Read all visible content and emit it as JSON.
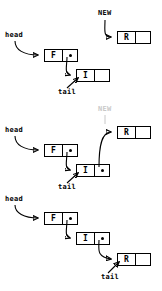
{
  "diagram": {
    "type": "linked-list-insertion",
    "labels": {
      "head": "head",
      "tail": "tail",
      "new": "NEW"
    },
    "node_values": {
      "first": "F",
      "middle": "I",
      "new": "R"
    },
    "colors": {
      "stroke": "#000000",
      "dim": "#c8c8c8",
      "background": "#ffffff"
    },
    "stages": [
      {
        "id": "stage-1",
        "caption": "",
        "nodes": [
          {
            "name": "node-f",
            "value": "F",
            "pointer": "filled"
          },
          {
            "name": "node-i",
            "value": "I",
            "pointer": "null"
          },
          {
            "name": "node-r",
            "value": "R",
            "pointer": "null"
          }
        ],
        "pointers": [
          {
            "from": "head",
            "to": "node-f"
          },
          {
            "from": "node-f",
            "to": "node-i"
          },
          {
            "from": "tail",
            "to": "node-i"
          },
          {
            "from": "NEW",
            "to": "node-r"
          }
        ]
      },
      {
        "id": "stage-2",
        "caption": "",
        "nodes": [
          {
            "name": "node-f",
            "value": "F",
            "pointer": "filled"
          },
          {
            "name": "node-i",
            "value": "I",
            "pointer": "filled"
          },
          {
            "name": "node-r",
            "value": "R",
            "pointer": "null"
          }
        ],
        "pointers": [
          {
            "from": "head",
            "to": "node-f"
          },
          {
            "from": "node-f",
            "to": "node-i"
          },
          {
            "from": "tail",
            "to": "node-i"
          },
          {
            "from": "node-i",
            "to": "node-r"
          },
          {
            "from": "NEW",
            "to": "node-r",
            "state": "dimmed"
          }
        ]
      },
      {
        "id": "stage-3",
        "caption": "",
        "nodes": [
          {
            "name": "node-f",
            "value": "F",
            "pointer": "filled"
          },
          {
            "name": "node-i",
            "value": "I",
            "pointer": "filled"
          },
          {
            "name": "node-r",
            "value": "R",
            "pointer": "null"
          }
        ],
        "pointers": [
          {
            "from": "head",
            "to": "node-f"
          },
          {
            "from": "node-f",
            "to": "node-i"
          },
          {
            "from": "node-i",
            "to": "node-r"
          },
          {
            "from": "tail",
            "to": "node-r"
          }
        ]
      }
    ]
  }
}
